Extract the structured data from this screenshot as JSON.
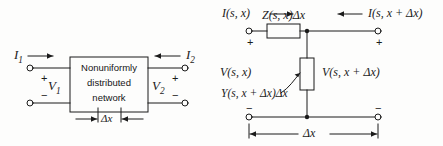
{
  "figure": {
    "ink_color": "#1b1b1b",
    "background_color": "#fdfdfc"
  },
  "left_diagram": {
    "name": "two-port-block-diagram",
    "box_lines": [
      "Nonuniformly",
      "distributed",
      "network"
    ],
    "input_current_label": "I",
    "input_current_sub": "1",
    "output_current_label": "I",
    "output_current_sub": "2",
    "input_voltage_label": "V",
    "input_voltage_sub": "1",
    "output_voltage_label": "V",
    "output_voltage_sub": "2",
    "plus_left": "+",
    "minus_left": "−",
    "plus_right": "+",
    "minus_right": "−",
    "delta_x_label": "Δx"
  },
  "right_diagram": {
    "name": "incremental-equivalent-circuit",
    "input_current_label": "I(s, x)",
    "output_current_label": "I(s, x + Δx)",
    "series_impedance_label": "Z(s, x)Δx",
    "shunt_admittance_label": "Y(s, x + Δx)Δx",
    "input_voltage_label": "V(s, x)",
    "output_voltage_label": "V(s, x + Δx)",
    "plus_left": "+",
    "minus_left": "−",
    "plus_right": "+",
    "minus_right": "−",
    "delta_x_label": "Δx"
  }
}
